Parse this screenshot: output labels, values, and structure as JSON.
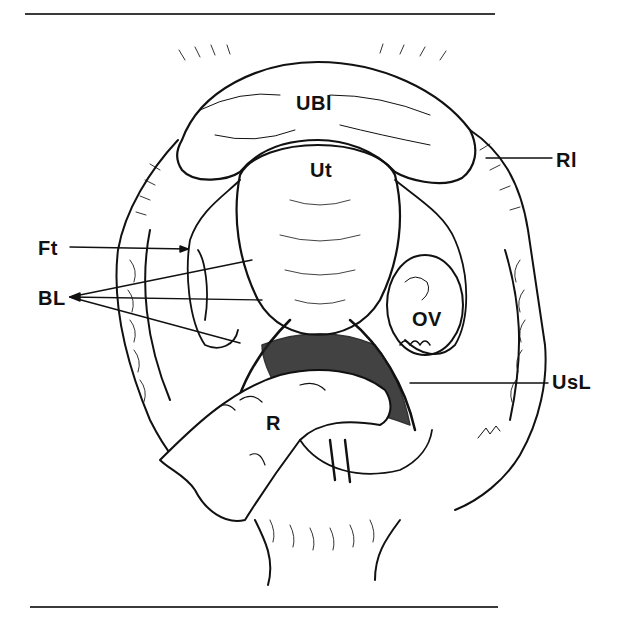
{
  "figure": {
    "type": "anatomical line drawing",
    "style": "black ink hatching on white",
    "colors": {
      "ink": "#111111",
      "background": "#ffffff",
      "rule": "#3a3a3a"
    },
    "labels": [
      {
        "id": "ubl",
        "text": "UBl",
        "x": 296,
        "y": 92
      },
      {
        "id": "ut",
        "text": "Ut",
        "x": 310,
        "y": 161
      },
      {
        "id": "rl",
        "text": "Rl",
        "x": 556,
        "y": 150
      },
      {
        "id": "ft",
        "text": "Ft",
        "x": 38,
        "y": 240
      },
      {
        "id": "bl",
        "text": "BL",
        "x": 38,
        "y": 290
      },
      {
        "id": "ov",
        "text": "OV",
        "x": 412,
        "y": 310
      },
      {
        "id": "usl",
        "text": "UsL",
        "x": 552,
        "y": 372
      },
      {
        "id": "r",
        "text": "R",
        "x": 266,
        "y": 413
      }
    ],
    "signature": "Bik"
  }
}
